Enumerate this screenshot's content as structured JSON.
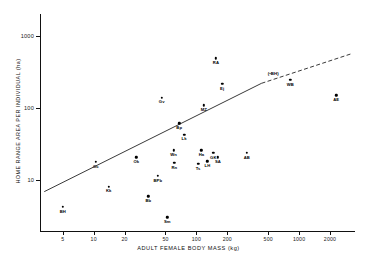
{
  "chart_data": {
    "type": "scatter",
    "title": "",
    "xlabel": "ADULT FEMALE BODY MASS (kg)",
    "ylabel": "HOME RANGE AREA PER INDIVIDUAL (ha)",
    "xscale": "log",
    "yscale": "log",
    "xlim": [
      3,
      3500
    ],
    "ylim": [
      2,
      2000
    ],
    "grid": false,
    "legend": "none",
    "xticks": [
      5,
      10,
      20,
      50,
      100,
      200,
      500,
      1000,
      2000
    ],
    "xticklabels": [
      "5",
      "10",
      "20",
      "50",
      "100",
      "200",
      "500",
      "1000",
      "2000"
    ],
    "yticks": [
      10,
      100,
      1000
    ],
    "yticklabels": [
      "10",
      "100",
      "1000"
    ],
    "points": [
      {
        "label": "BH",
        "x": 5.0,
        "y": 4.3
      },
      {
        "label": "Kk",
        "x": 14.0,
        "y": 8.2
      },
      {
        "label": "Oc",
        "x": 10.5,
        "y": 18.0
      },
      {
        "label": "Bb",
        "x": 34.0,
        "y": 6.0
      },
      {
        "label": "Sm",
        "x": 52.0,
        "y": 3.1
      },
      {
        "label": "Ok",
        "x": 26.0,
        "y": 21.0
      },
      {
        "label": "BPb",
        "x": 42.0,
        "y": 11.5
      },
      {
        "label": "Rn",
        "x": 61.0,
        "y": 17.5
      },
      {
        "label": "Wn",
        "x": 60.0,
        "y": 26.0
      },
      {
        "label": "Lk",
        "x": 76.0,
        "y": 43.0
      },
      {
        "label": "Bp",
        "x": 68.0,
        "y": 62.0
      },
      {
        "label": "Gv",
        "x": 46.0,
        "y": 140.0
      },
      {
        "label": "Ha",
        "x": 112.0,
        "y": 26.0
      },
      {
        "label": "Ts",
        "x": 104.0,
        "y": 17.0
      },
      {
        "label": "LH",
        "x": 128.0,
        "y": 18.5
      },
      {
        "label": "GK",
        "x": 146.0,
        "y": 24.0
      },
      {
        "label": "SA",
        "x": 162.0,
        "y": 21.0
      },
      {
        "label": "AB",
        "x": 310.0,
        "y": 24.0
      },
      {
        "label": "MZ",
        "x": 118.0,
        "y": 110.0
      },
      {
        "label": "Ej",
        "x": 178.0,
        "y": 215.0
      },
      {
        "label": "RA",
        "x": 155.0,
        "y": 490.0
      },
      {
        "label": "WB",
        "x": 820.0,
        "y": 245.0
      },
      {
        "label": "AE",
        "x": 2300.0,
        "y": 150.0
      }
    ],
    "annotations": [
      {
        "text": "(•BH)",
        "x": 560.0,
        "y": 330.0,
        "note": "parenthetical point label, upper right"
      }
    ],
    "fit_line": {
      "kind": "regression",
      "solid_from": {
        "x": 3.3,
        "y": 7.0
      },
      "solid_to": {
        "x": 430.0,
        "y": 220.0
      },
      "dashed_from": {
        "x": 430.0,
        "y": 220.0
      },
      "dashed_to": {
        "x": 3300.0,
        "y": 570.0
      },
      "style_solid": "solid",
      "style_dashed": "dashed"
    },
    "colors": {
      "axis": "#111111",
      "point": "#000000",
      "line": "#222222",
      "background": "#ffffff"
    }
  }
}
